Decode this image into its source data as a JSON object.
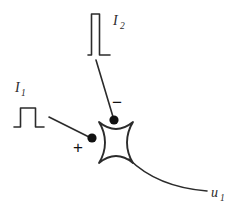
{
  "figure": {
    "type": "neuron-schematic-diagram",
    "background_color": "#ffffff",
    "stroke_color": "#2b2b2b",
    "dot_color": "#111111",
    "width": 238,
    "height": 215
  },
  "inputs": [
    {
      "id": "i1",
      "label": "I",
      "subscript": "1",
      "pulse_shape": "rectangular",
      "pulse_description": "wide short rectangular pulse",
      "synapse_sign": "+",
      "synapse_type": "excitatory"
    },
    {
      "id": "i2",
      "label": "I",
      "subscript": "2",
      "pulse_shape": "rectangular",
      "pulse_description": "narrow tall rectangular pulse",
      "synapse_sign": "−",
      "synapse_type": "inhibitory"
    }
  ],
  "soma": {
    "name": "astroid-cell-body",
    "shape": "four-pointed concave star"
  },
  "output": {
    "id": "u1",
    "label": "u",
    "subscript": "1",
    "description": "axon output"
  }
}
